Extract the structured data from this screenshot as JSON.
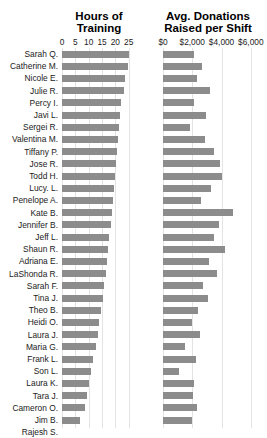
{
  "chart_data": {
    "type": "bar",
    "title": "",
    "orientation": "horizontal",
    "grid": true,
    "legend": null,
    "panels": [
      {
        "id": "hours",
        "title": "Hours of\nTraining",
        "xlabel": "",
        "ylabel": "",
        "xlim": [
          0,
          27
        ],
        "ticks": [
          {
            "label": "0",
            "value": 0
          },
          {
            "label": "5",
            "value": 5
          },
          {
            "label": "10",
            "value": 10
          },
          {
            "label": "15",
            "value": 15
          },
          {
            "label": "20",
            "value": 20
          },
          {
            "label": "25",
            "value": 25
          }
        ],
        "values": [
          25.0,
          24.6,
          23.8,
          23.2,
          22.2,
          21.8,
          21.4,
          21.0,
          20.6,
          20.2,
          19.8,
          19.4,
          19.0,
          18.6,
          18.2,
          17.8,
          17.4,
          17.0,
          16.4,
          15.8,
          15.2,
          14.6,
          14.0,
          13.4,
          12.6,
          11.8,
          11.0,
          10.2,
          9.4,
          8.6,
          6.8
        ]
      },
      {
        "id": "donations",
        "title": "Avg. Donations\nRaised per Shift",
        "xlabel": "",
        "ylabel": "",
        "xlim": [
          0,
          6900
        ],
        "ticks": [
          {
            "label": "$0",
            "value": 0
          },
          {
            "label": "$2,000",
            "value": 2000
          },
          {
            "label": "$4,000",
            "value": 4000
          },
          {
            "label": "$6,000",
            "value": 6000
          }
        ],
        "values": [
          2150,
          2650,
          2300,
          3200,
          2100,
          2950,
          1850,
          2850,
          3450,
          3900,
          4050,
          3300,
          2600,
          4800,
          3850,
          3500,
          4250,
          3150,
          3700,
          2750,
          3050,
          2400,
          1950,
          2500,
          1500,
          2250,
          1100,
          2150,
          2050,
          2300,
          2000
        ]
      }
    ],
    "categories": [
      "Sarah Q.",
      "Catherine M.",
      "Nicole E.",
      "Julie R.",
      "Percy I.",
      "Javi L.",
      "Sergei R.",
      "Valentina M.",
      "Tiffany P.",
      "Jose R.",
      "Todd H.",
      "Lucy. L.",
      "Penelope A.",
      "Kate B.",
      "Jennifer B.",
      "Jeff L.",
      "Shaun R.",
      "Adriana E.",
      "LaShonda R.",
      "Sarah F.",
      "Tina J.",
      "Theo B.",
      "Heidi O.",
      "Laura J.",
      "Maria G.",
      "Frank L.",
      "Son L.",
      "Laura K.",
      "Tara J.",
      "Cameron O.",
      "Jim B.",
      "Rajesh S."
    ],
    "colors": {
      "bar": "#8c8c8c",
      "grid": "#e3e3e3",
      "text": "#1b1b1b",
      "background": "#ffffff"
    }
  }
}
